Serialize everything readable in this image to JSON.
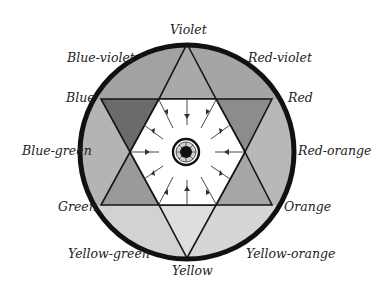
{
  "diagram": {
    "labels": [
      {
        "key": "violet",
        "text": "Violet",
        "x": 170,
        "y": 24
      },
      {
        "key": "red_violet",
        "text": "Red-violet",
        "x": 248,
        "y": 54
      },
      {
        "key": "red",
        "text": "Red",
        "x": 288,
        "y": 93
      },
      {
        "key": "red_orange",
        "text": "Red-orange",
        "x": 298,
        "y": 146
      },
      {
        "key": "orange",
        "text": "Orange",
        "x": 284,
        "y": 202
      },
      {
        "key": "yellow_orange",
        "text": "Yellow-orange",
        "x": 246,
        "y": 249
      },
      {
        "key": "yellow",
        "text": "Yellow",
        "x": 172,
        "y": 265
      },
      {
        "key": "yellow_green",
        "text": "Yellow-green",
        "x": 68,
        "y": 249
      },
      {
        "key": "green",
        "text": "Green",
        "x": 58,
        "y": 202
      },
      {
        "key": "blue_green",
        "text": "Blue-green",
        "x": 22,
        "y": 146
      },
      {
        "key": "blue",
        "text": "Blue",
        "x": 66,
        "y": 93
      },
      {
        "key": "blue_violet",
        "text": "Blue-violet",
        "x": 67,
        "y": 54
      }
    ],
    "segments": {
      "violet_point": "#a9a9a9",
      "blue_violet_region": "#a2a2a2",
      "red_violet_region": "#a5a5a5",
      "blue_point": "#6b6b6b",
      "red_point": "#8c8c8c",
      "blue_green_region": "#b4b4b4",
      "red_orange_region": "#b8b8b8",
      "green_point": "#9a9a9a",
      "orange_point": "#a6a6a6",
      "yellow_green_region": "#d2d2d2",
      "yellow_orange_region": "#d6d6d6",
      "yellow_point": "#dedede",
      "center_hexagon": "#ffffff"
    },
    "colors": {
      "outline": "#151515",
      "rim": "#111111",
      "text": "#222222"
    }
  }
}
